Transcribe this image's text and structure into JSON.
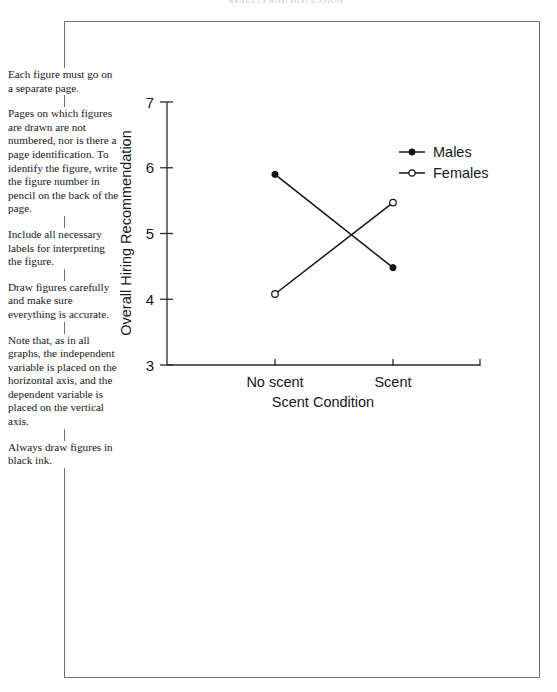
{
  "running_head": "RESULTS AND DISCUSSION",
  "notes": [
    "Each figure must go on a separate page.",
    "Pages on which figures are drawn are not numbered, nor is there a page identification. To identify the figure, write the figure number in pencil on the back of the page.",
    "Include all necessary labels for interpreting the figure.",
    "Draw figures carefully and make sure everything is accurate.",
    "Note that, as in all graphs, the independent variable is placed on the horizontal axis, and the dependent variable is placed on the vertical axis.",
    "Always draw figures in black ink."
  ],
  "chart_data": {
    "type": "line",
    "title": "",
    "xlabel": "Scent Condition",
    "ylabel": "Overall Hiring Recommendation",
    "categories": [
      "No scent",
      "Scent"
    ],
    "yticks": [
      3,
      4,
      5,
      6,
      7
    ],
    "ylim": [
      3,
      7
    ],
    "grid": false,
    "legend_position": "upper-right",
    "series": [
      {
        "name": "Males",
        "marker": "filled-circle",
        "values": [
          5.9,
          4.48
        ]
      },
      {
        "name": "Females",
        "marker": "open-circle",
        "values": [
          4.08,
          5.47
        ]
      }
    ]
  },
  "legend": {
    "males_label": "Males",
    "females_label": "Females"
  },
  "colors": {
    "ink": "#141418",
    "frame": "#6f6f77",
    "paper": "#ffffff"
  }
}
